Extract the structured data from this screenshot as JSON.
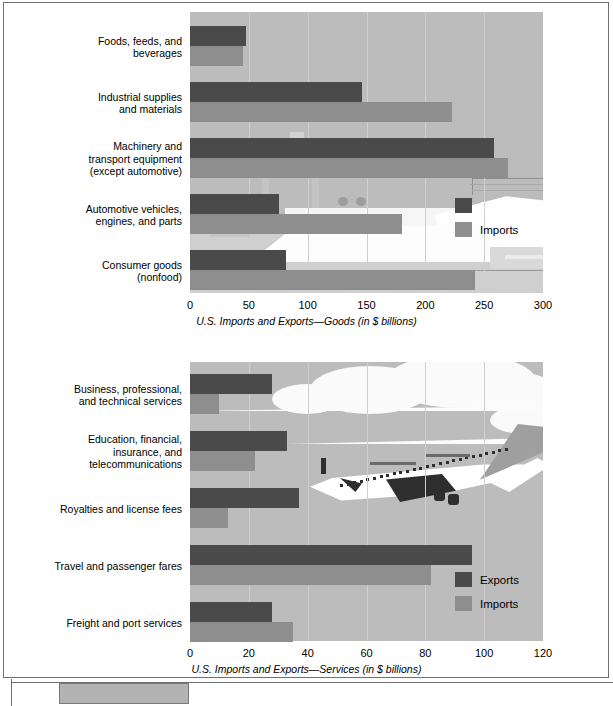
{
  "figure": {
    "legend_labels": {
      "exports": "Exports",
      "imports": "Imports"
    },
    "colors": {
      "exports": "#4a4a4a",
      "imports": "#8e8e8e",
      "plot_background": "#bcbcbc",
      "gridline": "#cfcfcf"
    }
  },
  "charts": [
    {
      "id": "goods",
      "axis_title": "U.S. Imports and Exports—Goods (in $ billions)",
      "ticks": [
        "0",
        "50",
        "100",
        "150",
        "200",
        "250",
        "300"
      ],
      "categories": [
        "Foods, feeds, and\nbeverages",
        "Industrial supplies\nand materials",
        "Machinery and\ntransport equipment\n(except automotive)",
        "Automotive vehicles,\nengines, and parts",
        "Consumer goods\n(nonfood)"
      ],
      "decoration": "cargo-ship-illustration"
    },
    {
      "id": "services",
      "axis_title": "U.S. Imports and Exports—Services (in $ billions)",
      "ticks": [
        "0",
        "20",
        "40",
        "60",
        "80",
        "100",
        "120"
      ],
      "categories": [
        "Business, professional,\nand technical services",
        "Education, financial,\ninsurance, and\ntelecommunications",
        "Royalties and license fees",
        "Travel and passenger fares",
        "Freight and port services"
      ],
      "decoration": "jet-airliner-illustration"
    }
  ],
  "chart_data": [
    {
      "type": "bar",
      "orientation": "horizontal",
      "title": "",
      "xlabel": "U.S. Imports and Exports—Goods (in $ billions)",
      "ylabel": "",
      "xlim": [
        0,
        300
      ],
      "xticks": [
        0,
        50,
        100,
        150,
        200,
        250,
        300
      ],
      "grid": true,
      "legend": "inside-right",
      "categories": [
        "Foods, feeds, and beverages",
        "Industrial supplies and materials",
        "Machinery and transport equipment (except automotive)",
        "Automotive vehicles, engines, and parts",
        "Consumer goods (nonfood)"
      ],
      "series": [
        {
          "name": "Exports",
          "color": "#4a4a4a",
          "values": [
            48,
            146,
            258,
            76,
            82
          ]
        },
        {
          "name": "Imports",
          "color": "#8e8e8e",
          "values": [
            45,
            223,
            270,
            180,
            242
          ]
        }
      ]
    },
    {
      "type": "bar",
      "orientation": "horizontal",
      "title": "",
      "xlabel": "U.S. Imports and Exports—Services (in $ billions)",
      "ylabel": "",
      "xlim": [
        0,
        120
      ],
      "xticks": [
        0,
        20,
        40,
        60,
        80,
        100,
        120
      ],
      "grid": true,
      "legend": "inside-right",
      "categories": [
        "Business, professional, and technical services",
        "Education, financial, insurance, and telecommunications",
        "Royalties and license fees",
        "Travel and passenger fares",
        "Freight and port services"
      ],
      "series": [
        {
          "name": "Exports",
          "color": "#4a4a4a",
          "values": [
            28,
            33,
            37,
            96,
            28
          ]
        },
        {
          "name": "Imports",
          "color": "#8e8e8e",
          "values": [
            10,
            22,
            13,
            82,
            35
          ]
        }
      ]
    }
  ]
}
